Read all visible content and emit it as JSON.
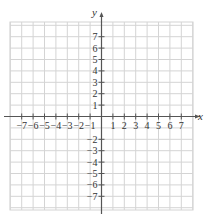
{
  "chart_data": {
    "type": "scatter",
    "title": "",
    "xlabel": "x",
    "ylabel": "y",
    "xlim": [
      -8,
      8
    ],
    "ylim": [
      -8,
      8
    ],
    "grid": true,
    "x_ticks": [
      -7,
      -6,
      -5,
      -4,
      -3,
      -2,
      -1,
      1,
      2,
      3,
      4,
      5,
      6,
      7
    ],
    "y_ticks": [
      7,
      6,
      5,
      4,
      3,
      2,
      1,
      -2,
      -3,
      -4,
      -5,
      -6,
      -7
    ],
    "x_tick_labels": [
      "−7",
      "−6",
      "−5",
      "−4",
      "−3",
      "−2",
      "−1",
      "1",
      "2",
      "3",
      "4",
      "5",
      "6",
      "7"
    ],
    "y_tick_labels": [
      "7",
      "6",
      "5",
      "4",
      "3",
      "2",
      "1",
      "−2",
      "−3",
      "−4",
      "−5",
      "−6",
      "−7"
    ],
    "series": [],
    "legend": null
  },
  "colors": {
    "grid": "#d4d4d4",
    "axis": "#555555",
    "text": "#333333"
  }
}
